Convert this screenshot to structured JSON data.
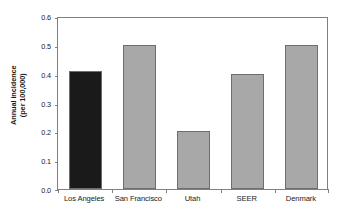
{
  "chart_data": {
    "type": "bar",
    "title": "",
    "subtitle": "",
    "xlabel": "",
    "ylabel": "Annual incidence (per 100,000)",
    "ylabel_lines": [
      "Annual incidence",
      "(per 100,000)"
    ],
    "categories": [
      "Los Angeles",
      "San Francisco",
      "Utah",
      "SEER",
      "Denmark"
    ],
    "values": [
      0.41,
      0.5,
      0.2,
      0.4,
      0.5
    ],
    "ylim": [
      0.0,
      0.6
    ],
    "ytick_values": [
      0.0,
      0.1,
      0.2,
      0.3,
      0.4,
      0.5,
      0.6
    ],
    "ytick_labels": [
      "0.0",
      "0.1",
      "0.2",
      "0.3",
      "0.4",
      "0.5",
      "0.6"
    ],
    "grid": false,
    "legend": false,
    "legend_position": "none",
    "bar_colors": [
      "#1a1a1a",
      "#a8a8a8",
      "#a8a8a8",
      "#a8a8a8",
      "#a8a8a8"
    ],
    "bar_edge_color": "#6e6e6e",
    "axis_color": "#808080",
    "text_color": "#1a1a1a",
    "background_color": "#ffffff",
    "highlight_category": "Los Angeles",
    "annotations": []
  }
}
